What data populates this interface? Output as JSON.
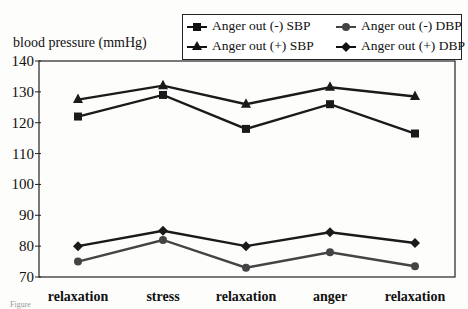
{
  "chart_data": {
    "type": "line",
    "title": "",
    "xlabel": "",
    "ylabel": "blood pressure (mmHg)",
    "ylim": [
      70,
      140
    ],
    "yticks": [
      70,
      80,
      90,
      100,
      110,
      120,
      130,
      140
    ],
    "categories": [
      "relaxation",
      "stress",
      "relaxation",
      "anger",
      "relaxation"
    ],
    "series": [
      {
        "name": "Anger out (-) SBP",
        "marker": "square",
        "color": "#1a1a1a",
        "values": [
          122,
          129,
          118,
          126,
          116.5
        ]
      },
      {
        "name": "Anger out (+) SBP",
        "marker": "triangle",
        "color": "#1a1a1a",
        "values": [
          127.5,
          132,
          126,
          131.5,
          128.5
        ]
      },
      {
        "name": "Anger out (-) DBP",
        "marker": "circle",
        "color": "#444444",
        "values": [
          75,
          82,
          73,
          78,
          73.5
        ]
      },
      {
        "name": "Anger out (+) DBP",
        "marker": "diamond",
        "color": "#1a1a1a",
        "values": [
          80,
          85,
          80,
          84.5,
          81
        ]
      }
    ],
    "legend_position": "top-right",
    "grid": false
  },
  "legend": {
    "items": [
      {
        "label": "Anger out (-) SBP"
      },
      {
        "label": "Anger out (-) DBP"
      },
      {
        "label": "Anger out (+) SBP"
      },
      {
        "label": "Anger out (+) DBP"
      }
    ]
  },
  "axis": {
    "ylabel": "blood pressure (mmHg)"
  },
  "caption": "Figure"
}
